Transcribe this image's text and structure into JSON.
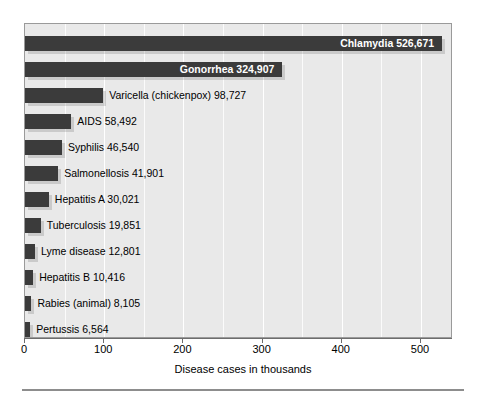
{
  "chart_data": {
    "type": "bar",
    "orientation": "horizontal",
    "title": "",
    "xlabel": "Disease cases in thousands",
    "ylabel": "",
    "xlim": [
      0,
      540
    ],
    "xticks": [
      0,
      100,
      200,
      300,
      400,
      500
    ],
    "xticklabels": [
      "0",
      "100",
      "200",
      "300",
      "400",
      "500"
    ],
    "grid": "vertical-white-minor-50",
    "legend": "none",
    "units": "thousands of cases",
    "categories": [
      "Chlamydia",
      "Gonorrhea",
      "Varicella (chickenpox)",
      "AIDS",
      "Syphilis",
      "Salmonellosis",
      "Hepatitis A",
      "Tuberculosis",
      "Lyme disease",
      "Hepatitis B",
      "Rabies (animal)",
      "Pertussis"
    ],
    "values": [
      526.671,
      324.907,
      98.727,
      58.492,
      46.54,
      41.901,
      30.021,
      19.851,
      12.801,
      10.416,
      8.105,
      6.564
    ],
    "bars": [
      {
        "name": "Chlamydia",
        "value": 526.671,
        "count_label": "526,671",
        "label": "Chlamydia  526,671",
        "label_position": "inside"
      },
      {
        "name": "Gonorrhea",
        "value": 324.907,
        "count_label": "324,907",
        "label": "Gonorrhea  324,907",
        "label_position": "inside"
      },
      {
        "name": "Varicella (chickenpox)",
        "value": 98.727,
        "count_label": "98,727",
        "label": "Varicella (chickenpox)  98,727",
        "label_position": "outside"
      },
      {
        "name": "AIDS",
        "value": 58.492,
        "count_label": "58,492",
        "label": "AIDS  58,492",
        "label_position": "outside"
      },
      {
        "name": "Syphilis",
        "value": 46.54,
        "count_label": "46,540",
        "label": "Syphilis  46,540",
        "label_position": "outside"
      },
      {
        "name": "Salmonellosis",
        "value": 41.901,
        "count_label": "41,901",
        "label": "Salmonellosis  41,901",
        "label_position": "outside"
      },
      {
        "name": "Hepatitis A",
        "value": 30.021,
        "count_label": "30,021",
        "label": "Hepatitis A  30,021",
        "label_position": "outside"
      },
      {
        "name": "Tuberculosis",
        "value": 19.851,
        "count_label": "19,851",
        "label": "Tuberculosis  19,851",
        "label_position": "outside"
      },
      {
        "name": "Lyme disease",
        "value": 12.801,
        "count_label": "12,801",
        "label": "Lyme disease  12,801",
        "label_position": "outside"
      },
      {
        "name": "Hepatitis B",
        "value": 10.416,
        "count_label": "10,416",
        "label": "Hepatitis B  10,416",
        "label_position": "outside"
      },
      {
        "name": "Rabies (animal)",
        "value": 8.105,
        "count_label": "8,105",
        "label": "Rabies (animal)  8,105",
        "label_position": "outside"
      },
      {
        "name": "Pertussis",
        "value": 6.564,
        "count_label": "6,564",
        "label": "Pertussis  6,564",
        "label_position": "outside"
      }
    ],
    "colors": {
      "bar": "#3b3b3b",
      "plot_background": "#e9e9e9",
      "gridline": "#ffffff",
      "axis": "#6d6d6d",
      "inside_label": "#ffffff",
      "outside_label": "#000000",
      "page_background": "#ffffff",
      "rule": "#8d8d8d"
    }
  }
}
